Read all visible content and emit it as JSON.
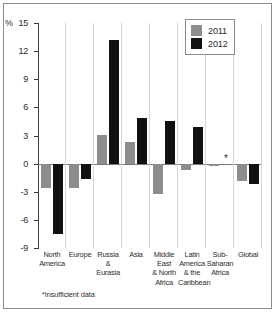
{
  "chart_data": {
    "type": "bar",
    "title": "",
    "subtitle": "",
    "xlabel": "",
    "ylabel": "%",
    "unit_label": "%",
    "ylim": [
      -9,
      15
    ],
    "yticks": [
      15,
      12,
      9,
      6,
      3,
      0,
      -3,
      -6,
      -9
    ],
    "ytick_labels": [
      "15",
      "12",
      "9",
      "6",
      "3",
      "0",
      "-3",
      "-6",
      "-9"
    ],
    "grid": false,
    "legend_position": "top-right",
    "categories": [
      "North America",
      "Europe",
      "Russia & Eurasia",
      "Asia",
      "Middle East & North Africa",
      "Latin America & the Caribbean",
      "Sub-Saharan Africa",
      "Global"
    ],
    "category_label_lines": [
      [
        "North",
        "America"
      ],
      [
        "Europe"
      ],
      [
        "Russia",
        "&",
        "Eurasia"
      ],
      [
        "Asia"
      ],
      [
        "Middle",
        "East",
        "& North",
        "Africa"
      ],
      [
        "Latin",
        "America",
        "& the",
        "Caribbean"
      ],
      [
        "Sub-",
        "Saharan",
        "Africa"
      ],
      [
        "Global"
      ]
    ],
    "series": [
      {
        "name": "2011",
        "color": "#8d8d8d",
        "values": [
          -2.6,
          -2.6,
          3.1,
          2.3,
          -3.2,
          -0.7,
          -0.3,
          -1.8
        ]
      },
      {
        "name": "2012",
        "color": "#111111",
        "values": [
          -7.5,
          -1.6,
          13.2,
          4.9,
          4.6,
          3.9,
          null,
          -2.2
        ]
      }
    ],
    "annotations": [
      {
        "text": "*",
        "category": "Sub-Saharan Africa",
        "series": "2012",
        "value": 0.5,
        "note": "Insufficient data"
      }
    ],
    "footnote": "*Insufficient data"
  },
  "legend": {
    "entries": [
      {
        "label": "2011",
        "color": "#8d8d8d"
      },
      {
        "label": "2012",
        "color": "#111111"
      }
    ]
  },
  "footnote": "*Insufficient data"
}
